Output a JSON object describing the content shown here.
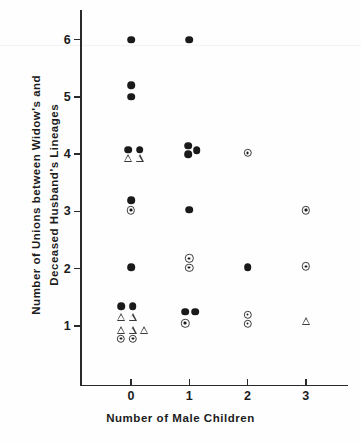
{
  "chart_data": {
    "type": "scatter",
    "title": "",
    "xlabel": "Number of Male Children",
    "ylabel": "Number of Unions between Widow's and Deceased Husband's Lineages",
    "ylabel_lines": [
      "Number of Unions between Widow's and",
      "Deceased Husband's Lineages"
    ],
    "xticks": [
      0,
      1,
      2,
      3
    ],
    "xtick_labels": [
      "0",
      "1",
      "2",
      "3"
    ],
    "yticks": [
      1,
      2,
      3,
      4,
      5,
      6
    ],
    "ytick_labels": [
      "1",
      "2",
      "3",
      "4",
      "5",
      "6"
    ],
    "xlim": [
      -0.85,
      3.6
    ],
    "ylim": [
      0.0,
      6.55
    ],
    "grid": false,
    "legend": null,
    "marker_types": [
      "filled-circle",
      "dotted-circle",
      "open-triangle"
    ],
    "series": [
      {
        "name": "filled-circle",
        "marker": "filled-circle",
        "points": [
          {
            "x": 0.0,
            "y": 6.0
          },
          {
            "x": 1.0,
            "y": 6.0
          },
          {
            "x": 0.0,
            "y": 5.2
          },
          {
            "x": 0.0,
            "y": 5.0
          },
          {
            "x": -0.05,
            "y": 4.08
          },
          {
            "x": 0.15,
            "y": 4.08
          },
          {
            "x": 0.98,
            "y": 4.15
          },
          {
            "x": 1.13,
            "y": 4.07
          },
          {
            "x": 0.98,
            "y": 4.0
          },
          {
            "x": 0.0,
            "y": 3.2
          },
          {
            "x": 1.0,
            "y": 3.03
          },
          {
            "x": 0.0,
            "y": 2.03
          },
          {
            "x": 2.0,
            "y": 2.03
          },
          {
            "x": -0.17,
            "y": 1.35
          },
          {
            "x": 0.03,
            "y": 1.35
          },
          {
            "x": 0.93,
            "y": 1.25
          },
          {
            "x": 1.1,
            "y": 1.25
          }
        ]
      },
      {
        "name": "dotted-circle",
        "marker": "dotted-circle",
        "points": [
          {
            "x": 2.0,
            "y": 4.02
          },
          {
            "x": 0.0,
            "y": 3.02
          },
          {
            "x": 3.0,
            "y": 3.02
          },
          {
            "x": 1.0,
            "y": 2.18
          },
          {
            "x": 1.0,
            "y": 2.02
          },
          {
            "x": 3.0,
            "y": 2.04
          },
          {
            "x": 2.0,
            "y": 1.2
          },
          {
            "x": 2.0,
            "y": 1.04
          },
          {
            "x": 0.93,
            "y": 1.05
          },
          {
            "x": -0.17,
            "y": 0.78
          },
          {
            "x": 0.03,
            "y": 0.78
          }
        ]
      },
      {
        "name": "open-triangle",
        "marker": "open-triangle",
        "points": [
          {
            "x": -0.05,
            "y": 3.94
          },
          {
            "x": 0.15,
            "y": 3.94
          },
          {
            "x": -0.17,
            "y": 1.15
          },
          {
            "x": 0.03,
            "y": 1.15
          },
          {
            "x": -0.17,
            "y": 0.93
          },
          {
            "x": 0.03,
            "y": 0.93
          },
          {
            "x": 0.23,
            "y": 0.93
          },
          {
            "x": 3.0,
            "y": 1.08
          }
        ]
      }
    ]
  }
}
